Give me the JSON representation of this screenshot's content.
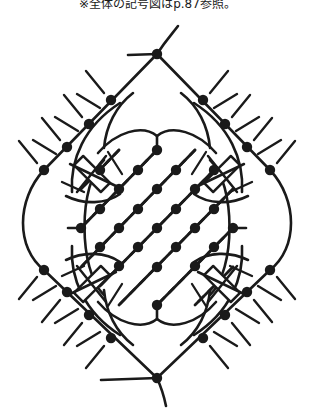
{
  "caption": {
    "text": "※全体の記号図はp.87参照。"
  },
  "diagram": {
    "colors": {
      "ink": "#1a1a1a",
      "background": "#ffffff"
    },
    "stroke": {
      "outline_width": 2.6,
      "lattice_solid_width": 2.8,
      "lattice_dash_width": 2.6,
      "lattice_dash_pattern": "7 7",
      "tick_width": 2.4,
      "clasp_width": 2.4
    },
    "node": {
      "radius": 5.2,
      "count": 49,
      "label": "knot-node"
    },
    "geometry": {
      "center_x": 157,
      "center_y": 195,
      "top_vertex": [
        157,
        40
      ],
      "bottom_vertex": [
        157,
        364
      ],
      "left_extent": 28,
      "right_extent": 288
    },
    "outline_nodes": [
      [
        157,
        40
      ],
      [
        111,
        86
      ],
      [
        89,
        110
      ],
      [
        67,
        133
      ],
      [
        44,
        156
      ],
      [
        203,
        86
      ],
      [
        225,
        110
      ],
      [
        247,
        133
      ],
      [
        270,
        156
      ],
      [
        44,
        256
      ],
      [
        67,
        278
      ],
      [
        89,
        301
      ],
      [
        111,
        324
      ],
      [
        270,
        256
      ],
      [
        247,
        278
      ],
      [
        225,
        301
      ],
      [
        203,
        324
      ],
      [
        157,
        364
      ]
    ],
    "lattice_nodes": [
      [
        157,
        136
      ],
      [
        119,
        175
      ],
      [
        81,
        214
      ],
      [
        119,
        252
      ],
      [
        157,
        291
      ],
      [
        195,
        175
      ],
      [
        233,
        214
      ],
      [
        195,
        252
      ],
      [
        138,
        156
      ],
      [
        100,
        195
      ],
      [
        138,
        233
      ],
      [
        176,
        156
      ],
      [
        214,
        195
      ],
      [
        176,
        233
      ],
      [
        157,
        175
      ],
      [
        119,
        214
      ],
      [
        157,
        253
      ],
      [
        195,
        214
      ],
      [
        176,
        195
      ],
      [
        138,
        195
      ],
      [
        157,
        214
      ],
      [
        100,
        233
      ],
      [
        214,
        233
      ],
      [
        100,
        156
      ],
      [
        214,
        156
      ]
    ],
    "clasps": [
      {
        "cx": 92,
        "cy": 160,
        "angle": 45,
        "w": 38,
        "h": 13,
        "name": "clasp-top-left"
      },
      {
        "cx": 222,
        "cy": 160,
        "angle": -45,
        "w": 38,
        "h": 13,
        "name": "clasp-top-right"
      },
      {
        "cx": 92,
        "cy": 270,
        "angle": -45,
        "w": 38,
        "h": 13,
        "name": "clasp-bottom-left"
      },
      {
        "cx": 222,
        "cy": 270,
        "angle": 45,
        "w": 38,
        "h": 13,
        "name": "clasp-bottom-right"
      }
    ],
    "legend": {
      "solid_line": "solid-thread",
      "dashed_line": "dashed-thread",
      "node": "knot-point",
      "clasp": "bar-clasp",
      "tick": "fringe-tick",
      "arc": "loop-arc"
    }
  }
}
